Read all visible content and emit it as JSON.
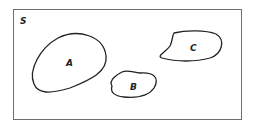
{
  "diagram": {
    "universe_label": "S",
    "sets": [
      {
        "label": "A"
      },
      {
        "label": "B"
      },
      {
        "label": "C"
      }
    ],
    "colors": {
      "stroke": "#222222",
      "frame": "#6e6e6e",
      "background": "#ffffff"
    }
  }
}
